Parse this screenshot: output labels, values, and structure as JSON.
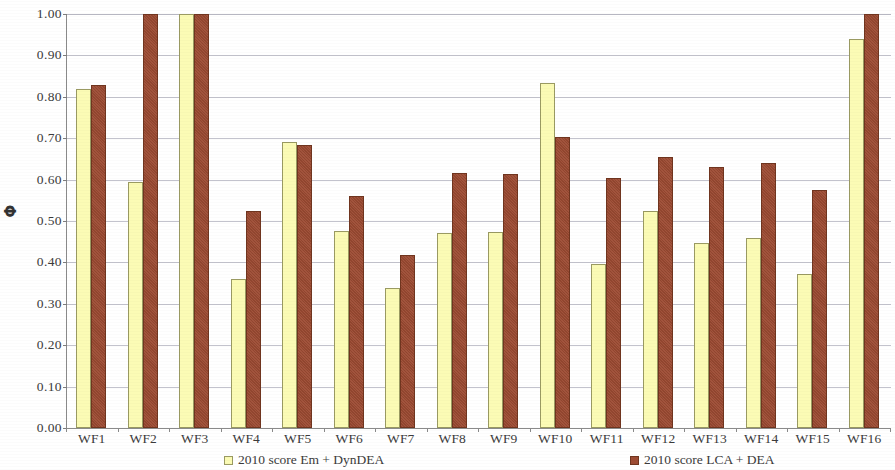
{
  "chart_data": {
    "type": "bar",
    "title": "",
    "subtitle": "",
    "xlabel": "",
    "ylabel": "Φ",
    "ylim": [
      0.0,
      1.0
    ],
    "ytick_labels": [
      "0.00",
      "0.10",
      "0.20",
      "0.30",
      "0.40",
      "0.50",
      "0.60",
      "0.70",
      "0.80",
      "0.90",
      "1.00"
    ],
    "ytick_values": [
      0.0,
      0.1,
      0.2,
      0.3,
      0.4,
      0.5,
      0.6,
      0.7,
      0.8,
      0.9,
      1.0
    ],
    "grid": true,
    "grid_axis": "y",
    "legend_position": "bottom",
    "categories": [
      "WF1",
      "WF2",
      "WF3",
      "WF4",
      "WF5",
      "WF6",
      "WF7",
      "WF8",
      "WF9",
      "WF10",
      "WF11",
      "WF12",
      "WF13",
      "WF14",
      "WF15",
      "WF16"
    ],
    "series": [
      {
        "name": "2010 score Em + DynDEA",
        "color": "#fbfbb5",
        "values": [
          0.82,
          0.595,
          1.0,
          0.36,
          0.69,
          0.475,
          0.338,
          0.472,
          0.474,
          0.834,
          0.396,
          0.524,
          0.448,
          0.46,
          0.372,
          0.94
        ]
      },
      {
        "name": "2010 score LCA + DEA",
        "color": "#9d4b33",
        "values": [
          0.828,
          1.0,
          1.0,
          0.524,
          0.684,
          0.561,
          0.418,
          0.617,
          0.613,
          0.703,
          0.604,
          0.655,
          0.63,
          0.64,
          0.576,
          1.0
        ]
      }
    ]
  },
  "legend": {
    "items": [
      {
        "label": "2010 score Em + DynDEA"
      },
      {
        "label": "2010 score LCA + DEA"
      }
    ]
  },
  "colors": {
    "series_a": "#fbfbb5",
    "series_b": "#9d4b33",
    "gridline": "#b9b9c4",
    "axis": "#8a8a8a",
    "text": "#3b3b3b"
  }
}
